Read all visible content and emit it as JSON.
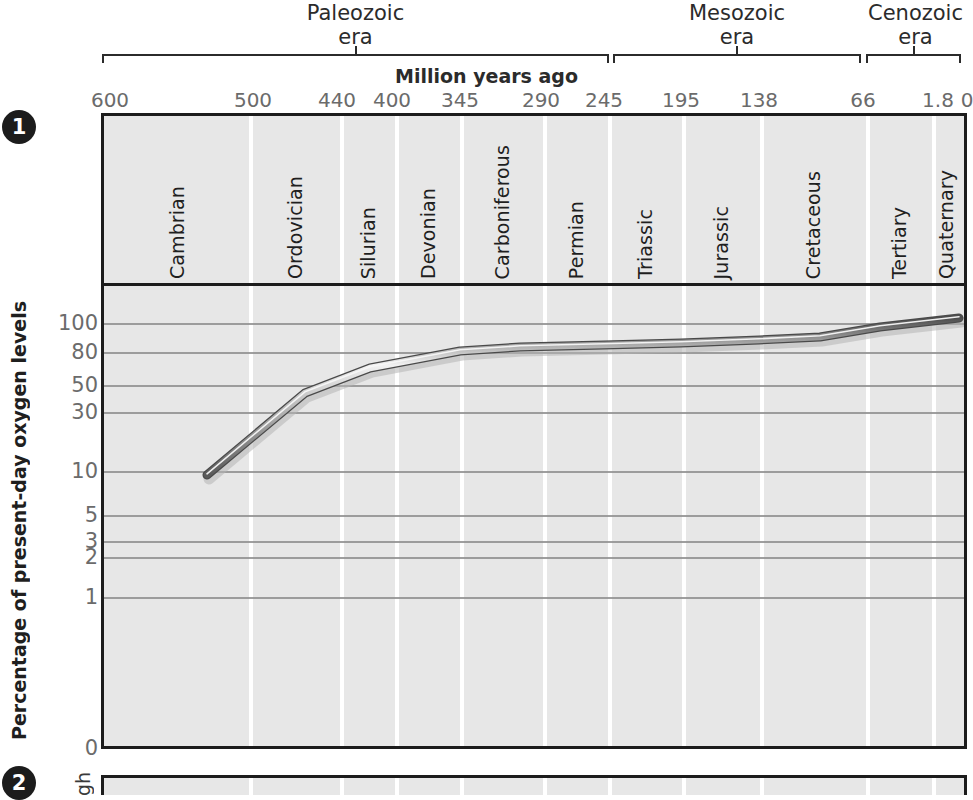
{
  "figure": {
    "badges": [
      {
        "name": "panel-1-badge",
        "label": "1"
      },
      {
        "name": "panel-2-badge",
        "label": "2"
      }
    ]
  },
  "eras": [
    {
      "name": "Paleozoic",
      "sub": "era",
      "x0": 102,
      "x1": 609
    },
    {
      "name": "Mesozoic",
      "sub": "era",
      "x0": 613,
      "x1": 861
    },
    {
      "name": "Cenozoic",
      "sub": "era",
      "x0": 866,
      "x1": 961
    }
  ],
  "chart_data": {
    "type": "line",
    "xlabel": "Million years ago",
    "ylabel": "Percentage of present-day oxygen levels",
    "grid": true,
    "legend": "none",
    "xaxis": {
      "label": "Million years ago",
      "ticks": [
        600,
        500,
        440,
        400,
        345,
        290,
        245,
        195,
        138,
        66,
        1.8,
        0
      ],
      "tick_labels": [
        "600",
        "500",
        "440",
        "400",
        "345",
        "290",
        "245",
        "195",
        "138",
        "66",
        "1.8",
        "0"
      ],
      "tick_px": [
        110,
        253,
        337,
        392,
        460,
        541,
        604,
        681,
        759,
        863,
        938,
        967
      ],
      "direction": "reversed",
      "unit": "million years ago"
    },
    "yaxis": {
      "label": "Percentage of present-day oxygen levels",
      "scale": "log-like",
      "ticks": [
        100,
        80,
        50,
        30,
        10,
        5,
        3,
        2,
        1,
        0
      ],
      "tick_labels": [
        "100",
        "80",
        "50",
        "30",
        "10",
        "5",
        "3",
        "2",
        "1",
        "0"
      ],
      "tick_px": [
        323,
        352,
        385,
        412,
        471,
        515,
        541,
        557,
        597,
        748
      ],
      "ylim": [
        0,
        110
      ]
    },
    "periods": [
      {
        "name": "Cambrian",
        "start_mya": 600,
        "end_mya": 505,
        "x0": 104,
        "x1": 249
      },
      {
        "name": "Ordovician",
        "start_mya": 505,
        "end_mya": 440,
        "x0": 249,
        "x1": 340
      },
      {
        "name": "Silurian",
        "start_mya": 440,
        "end_mya": 400,
        "x0": 340,
        "x1": 395
      },
      {
        "name": "Devonian",
        "start_mya": 400,
        "end_mya": 345,
        "x0": 395,
        "x1": 460
      },
      {
        "name": "Carboniferous",
        "start_mya": 345,
        "end_mya": 290,
        "x0": 460,
        "x1": 543
      },
      {
        "name": "Permian",
        "start_mya": 290,
        "end_mya": 245,
        "x0": 543,
        "x1": 608
      },
      {
        "name": "Triassic",
        "start_mya": 245,
        "end_mya": 195,
        "x0": 608,
        "x1": 682
      },
      {
        "name": "Jurassic",
        "start_mya": 195,
        "end_mya": 138,
        "x0": 682,
        "x1": 760
      },
      {
        "name": "Cretaceous",
        "start_mya": 138,
        "end_mya": 66,
        "x0": 760,
        "x1": 866
      },
      {
        "name": "Tertiary",
        "start_mya": 66,
        "end_mya": 1.8,
        "x0": 866,
        "x1": 932
      },
      {
        "name": "Quaternary",
        "start_mya": 1.8,
        "end_mya": 0,
        "x0": 932,
        "x1": 960
      }
    ],
    "series": [
      {
        "name": "Atmospheric oxygen",
        "x": [
          530,
          455,
          400,
          345,
          290,
          245,
          195,
          138,
          66,
          30,
          0
        ],
        "y": [
          9,
          45,
          62,
          78,
          80,
          80,
          81,
          82,
          84,
          95,
          105
        ],
        "points_px": [
          [
            207,
            475
          ],
          [
            305,
            393
          ],
          [
            370,
            368
          ],
          [
            460,
            351
          ],
          [
            520,
            347
          ],
          [
            604,
            345
          ],
          [
            681,
            343
          ],
          [
            759,
            340
          ],
          [
            820,
            337
          ],
          [
            880,
            327
          ],
          [
            959,
            318
          ]
        ]
      }
    ]
  },
  "panel2": {
    "ylabel_fragment": "gh"
  }
}
